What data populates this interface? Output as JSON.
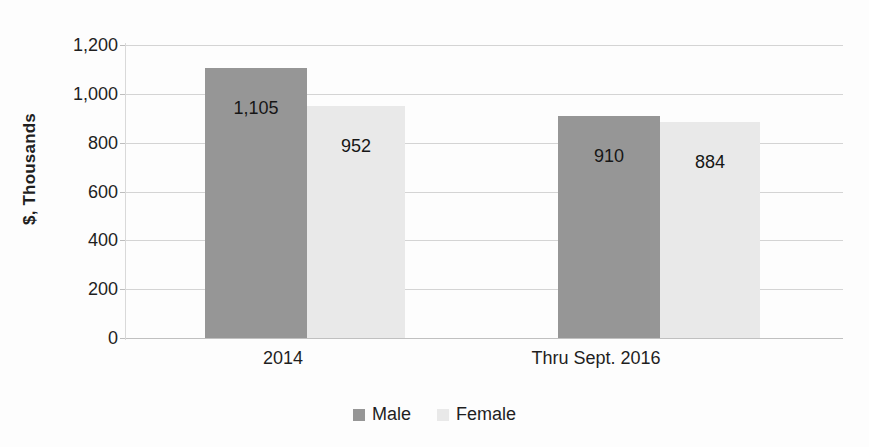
{
  "chart_data": {
    "type": "bar",
    "title": "",
    "xlabel": "",
    "ylabel": "$, Thousands",
    "categories": [
      "2014",
      "Thru Sept. 2016"
    ],
    "series": [
      {
        "name": "Male",
        "values": [
          1105,
          910
        ],
        "color": "#969696"
      },
      {
        "name": "Female",
        "values": [
          952,
          884
        ],
        "color": "#e9e9e9"
      }
    ],
    "value_labels": {
      "male": [
        "1,105",
        "910"
      ],
      "female": [
        "952",
        "884"
      ]
    },
    "ylim": [
      0,
      1200
    ],
    "yticks": [
      0,
      200,
      400,
      600,
      800,
      1000,
      1200
    ],
    "ytick_labels": [
      "0",
      "200",
      "400",
      "600",
      "800",
      "1,000",
      "1,200"
    ],
    "grid": true,
    "legend_position": "bottom",
    "legend": [
      "Male",
      "Female"
    ]
  },
  "axis": {
    "y_title": "$, Thousands",
    "ticks": [
      {
        "label": "1,200",
        "value": 1200
      },
      {
        "label": "1,000",
        "value": 1000
      },
      {
        "label": "800",
        "value": 800
      },
      {
        "label": "600",
        "value": 600
      },
      {
        "label": "400",
        "value": 400
      },
      {
        "label": "200",
        "value": 200
      },
      {
        "label": "0",
        "value": 0
      }
    ]
  },
  "groups": [
    {
      "category": "2014",
      "bars": [
        {
          "series": "Male",
          "value": 1105,
          "label": "1,105"
        },
        {
          "series": "Female",
          "value": 952,
          "label": "952"
        }
      ]
    },
    {
      "category": "Thru Sept. 2016",
      "bars": [
        {
          "series": "Male",
          "value": 910,
          "label": "910"
        },
        {
          "series": "Female",
          "value": 884,
          "label": "884"
        }
      ]
    }
  ],
  "legend": {
    "items": [
      {
        "label": "Male",
        "color": "#969696"
      },
      {
        "label": "Female",
        "color": "#e9e9e9"
      }
    ]
  },
  "colors": {
    "male": "#969696",
    "female": "#e9e9e9",
    "gridline": "#d4d4d4",
    "text": "#1f1f1f",
    "background": "#fdfdfd"
  }
}
